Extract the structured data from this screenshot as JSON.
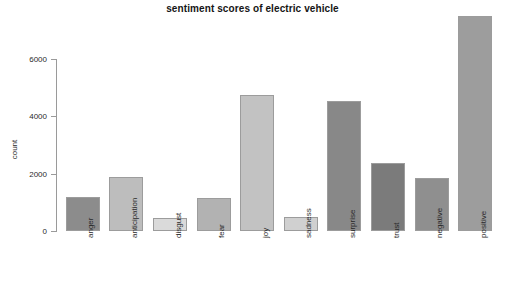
{
  "chart_data": {
    "type": "bar",
    "title": "sentiment scores of electric vehicle",
    "xlabel": "",
    "ylabel": "count",
    "categories": [
      "anger",
      "anticipation",
      "disgust",
      "fear",
      "joy",
      "sadness",
      "surprise",
      "trust",
      "negative",
      "positive"
    ],
    "values": [
      1200,
      1900,
      450,
      1150,
      4760,
      490,
      4530,
      2370,
      1850,
      7500
    ],
    "bar_colors": [
      "#8c8c8c",
      "#bdbdbd",
      "#dadada",
      "#b2b2b2",
      "#c2c2c2",
      "#d0d0d0",
      "#888888",
      "#7b7b7b",
      "#8f8f8f",
      "#9d9d9d"
    ],
    "border_color": "#9c9c9c",
    "ylim": [
      0,
      7700
    ],
    "yticks": [
      0,
      2000,
      4000,
      6000
    ],
    "ytick_labels": [
      "0",
      "2000",
      "4000",
      "6000"
    ],
    "grid": false,
    "legend": false,
    "background": "#ffffff",
    "axis_color": "#9a9a9a",
    "text_color": "#2a2a2a",
    "tick_label_rotation": -90
  }
}
